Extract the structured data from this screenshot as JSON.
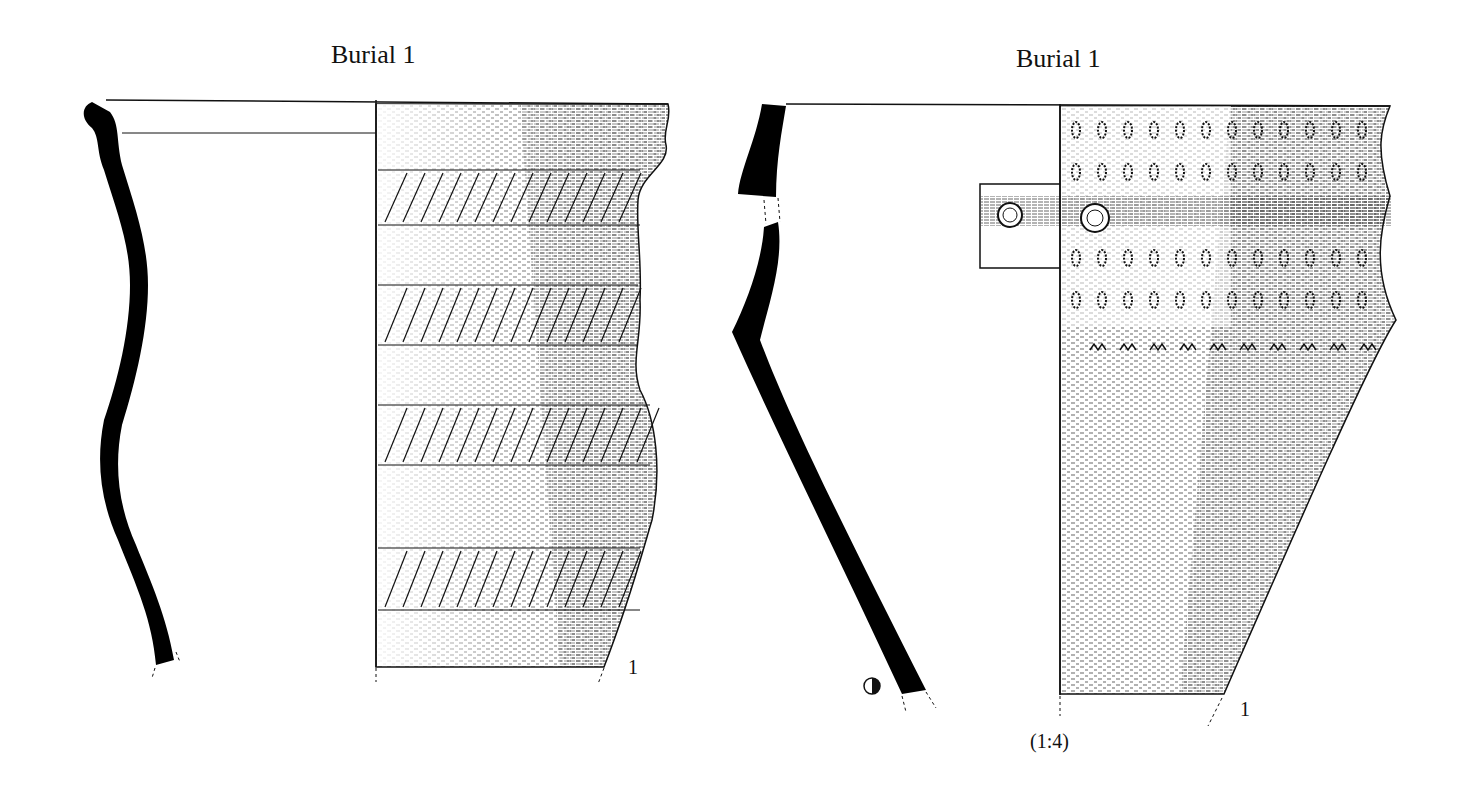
{
  "figure": {
    "vessel_1": {
      "title": "Burial 1",
      "number_label": "1",
      "decoration": "incised herringbone bands"
    },
    "vessel_2": {
      "title": "Burial 1",
      "number_label": "1",
      "decoration": "stamped impressions and perforated holes"
    },
    "scale_label": "(1:4)",
    "colors": {
      "ink": "#111111",
      "paper": "#ffffff"
    }
  }
}
